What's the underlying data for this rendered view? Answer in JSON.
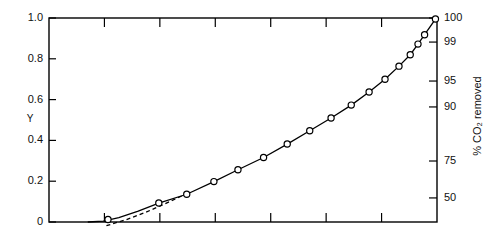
{
  "chart_data": {
    "type": "line",
    "title": "",
    "subtitle": "",
    "ylabel": "Y",
    "xlabel": "",
    "ylabel_right": "% CO2 removed",
    "ylabel_right_display": "% CO₂ removed",
    "grid": false,
    "legend": "none",
    "ylim": [
      0,
      1.0
    ],
    "xlim": [
      0,
      1.0
    ],
    "left_axis": {
      "label": "Y",
      "scale": "linear",
      "range": [
        0,
        1.0
      ],
      "ticks": [
        0,
        0.2,
        0.4,
        0.6,
        0.8,
        1.0
      ],
      "tick_labels": [
        "0",
        "0.2",
        "0.4",
        "0.6",
        "0.8",
        "1.0"
      ]
    },
    "right_axis": {
      "label": "% CO₂ removed",
      "scale": "probability",
      "ticks": [
        50,
        75,
        90,
        95,
        99,
        100
      ],
      "tick_labels": [
        "50",
        "75",
        "90",
        "95",
        "99",
        "100"
      ],
      "tick_positions_y_fraction": [
        0.882,
        0.701,
        0.436,
        0.309,
        0.118,
        0.0
      ]
    },
    "bottom_axis": {
      "label": "",
      "ticks_unlabeled": true,
      "tick_count": 6,
      "tick_labels": []
    },
    "top_axis": {
      "label": "",
      "ticks_unlabeled": true,
      "tick_count": 6,
      "tick_labels": []
    },
    "series": [
      {
        "name": "data",
        "marker": "open-circle",
        "line": "solid",
        "x": [
          0.152,
          0.283,
          0.355,
          0.425,
          0.487,
          0.553,
          0.614,
          0.672,
          0.727,
          0.779,
          0.825,
          0.866,
          0.902,
          0.931,
          0.951,
          0.968,
          0.996
        ],
        "y": [
          0.012,
          0.093,
          0.136,
          0.198,
          0.256,
          0.316,
          0.382,
          0.447,
          0.51,
          0.573,
          0.637,
          0.7,
          0.764,
          0.82,
          0.872,
          0.918,
          0.995
        ]
      },
      {
        "name": "reference",
        "marker": "none",
        "line": "dashed",
        "x": [
          0.148,
          0.2,
          0.25,
          0.3,
          0.345
        ],
        "y": [
          -0.018,
          0.012,
          0.048,
          0.09,
          0.13
        ]
      }
    ],
    "curve_fit": {
      "description": "solid fitted curve through plotted points",
      "x": [
        0.1,
        0.14,
        0.18,
        0.23,
        0.283,
        0.355,
        0.425,
        0.487,
        0.553,
        0.614,
        0.672,
        0.727,
        0.779,
        0.825,
        0.866,
        0.902,
        0.931,
        0.951,
        0.968,
        0.996
      ],
      "y": [
        0.0,
        0.004,
        0.022,
        0.053,
        0.093,
        0.136,
        0.198,
        0.256,
        0.316,
        0.382,
        0.447,
        0.51,
        0.573,
        0.637,
        0.7,
        0.764,
        0.82,
        0.872,
        0.918,
        0.995
      ]
    }
  }
}
